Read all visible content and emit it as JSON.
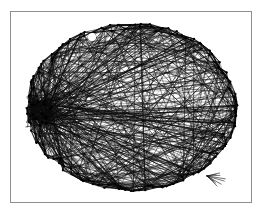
{
  "figure": {
    "kind": "graph-drawing",
    "title": "",
    "caption": "",
    "background_color": "#ffffff",
    "frame": {
      "visible": true,
      "color": "#8f8f8f",
      "line_width": 1,
      "x": 10,
      "y": 11,
      "width": 242,
      "height": 192
    }
  },
  "chart_data": {
    "type": "scatter",
    "title": "",
    "subtitle": "",
    "xlabel": "",
    "ylabel": "",
    "grid": false,
    "legend": null,
    "annotations": [],
    "xlim": [
      10,
      252
    ],
    "ylim": [
      11,
      203
    ],
    "layout": {
      "shape": "ellipse",
      "center_x": 132,
      "center_y": 107,
      "radius_x": 106,
      "radius_y": 84,
      "perimeter_band": 9
    },
    "style": {
      "edge_color": "#0a0a0a",
      "edge_width": 0.55,
      "edge_opacity": 0.82,
      "node_color": "#000000",
      "node_radius": 1.1,
      "fill_color": "#ffffff"
    },
    "counts": {
      "nodes": 150,
      "edges": 560
    },
    "features": [
      {
        "name": "left-hub-cluster",
        "x": 41,
        "y": 112,
        "radius": 13,
        "density": "very-high"
      },
      {
        "name": "white-hole-top-left",
        "x": 92,
        "y": 37,
        "radius": 4
      },
      {
        "name": "lower-right-spur",
        "x": 207,
        "y": 176,
        "length": 16
      }
    ],
    "random_seed": 20240917
  }
}
